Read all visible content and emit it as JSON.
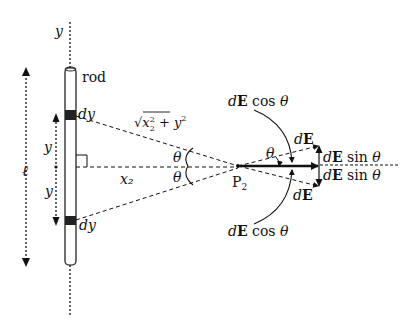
{
  "figure": {
    "labels": {
      "y_axis": "y",
      "rod": "rod",
      "dy_top": "dy",
      "dy_bottom": "dy",
      "length": "ℓ",
      "y_upper": "y",
      "y_lower": "y",
      "distance": "x₂",
      "hypotenuse": "√(x₂² + y²)",
      "theta_upper": "θ",
      "theta_lower": "θ",
      "theta_at_point": "θ",
      "point": "P₂",
      "dE_top": "dE",
      "dE_bottom": "dE",
      "dE_cos_top": "dE cos θ",
      "dE_cos_bottom": "dE cos θ",
      "dE_sin_top": "dE sin θ",
      "dE_sin_bottom": "dE sin θ"
    },
    "colors": {
      "ink": "#111111",
      "rod_fill": "#ffffff",
      "charge_element": "#222222"
    }
  }
}
